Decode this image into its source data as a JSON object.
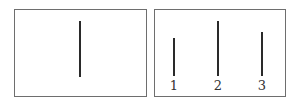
{
  "diagram": {
    "left_panel": {
      "lines": [
        {
          "x": 64,
          "top": 11,
          "bottom": 67
        }
      ]
    },
    "right_panel": {
      "lines": [
        {
          "label": "1",
          "x": 18,
          "top": 28,
          "bottom": 66
        },
        {
          "label": "2",
          "x": 62,
          "top": 11,
          "bottom": 66
        },
        {
          "label": "3",
          "x": 106,
          "top": 22,
          "bottom": 66
        }
      ]
    }
  }
}
